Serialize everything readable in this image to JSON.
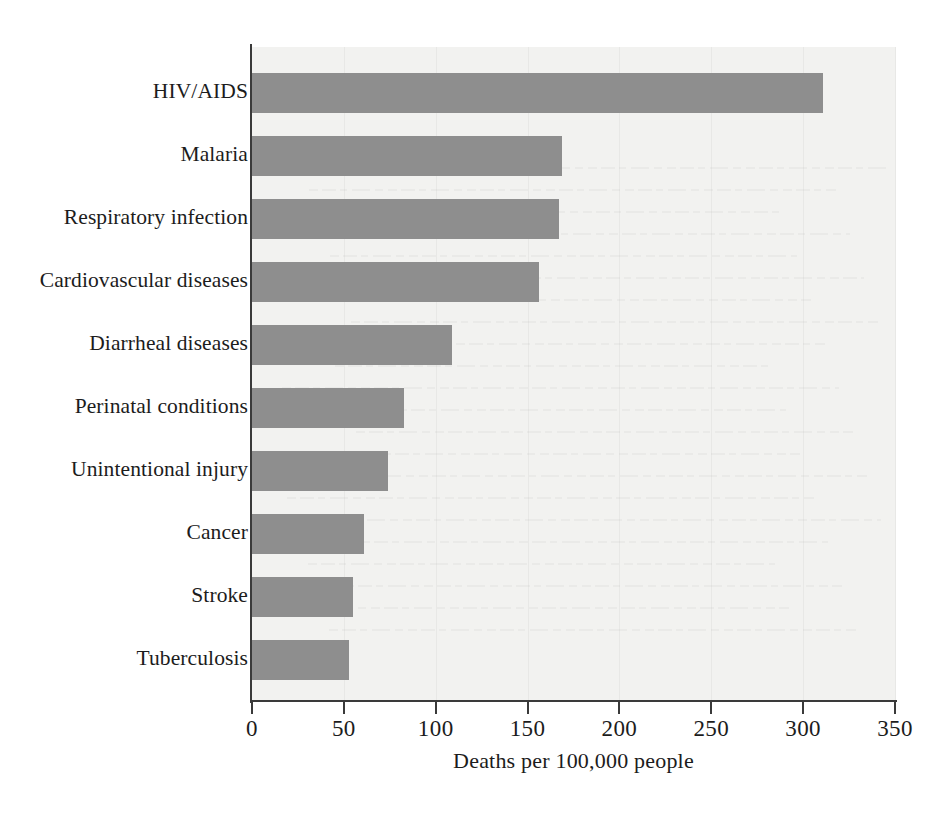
{
  "chart_data": {
    "type": "bar",
    "orientation": "horizontal",
    "title": "",
    "xlabel": "Deaths per 100,000 people",
    "ylabel": "",
    "xlim": [
      0,
      350
    ],
    "ylim": null,
    "xticks": [
      0,
      50,
      100,
      150,
      200,
      250,
      300,
      350
    ],
    "xtick_labels": [
      "0",
      "50",
      "100",
      "150",
      "200",
      "250",
      "300",
      "350"
    ],
    "grid": true,
    "grid_axis": "x",
    "legend": null,
    "categories": [
      "HIV/AIDS",
      "Malaria",
      "Respiratory infection",
      "Cardiovascular diseases",
      "Diarrheal diseases",
      "Perinatal conditions",
      "Unintentional injury",
      "Cancer",
      "Stroke",
      "Tuberculosis"
    ],
    "values": [
      311,
      169,
      167,
      156,
      109,
      83,
      74,
      61,
      55,
      53
    ],
    "bar_color": "#8e8e8e",
    "plot_background": "#f2f2f0",
    "axis_color": "#3a3a3a"
  }
}
